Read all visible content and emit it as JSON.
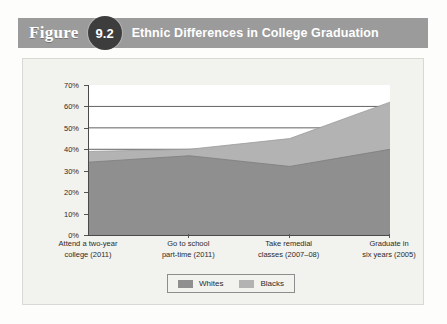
{
  "figure": {
    "word": "Figure",
    "number": "9.2",
    "title": "Ethnic Differences in College Graduation"
  },
  "colors": {
    "banner": "#9b9b9b",
    "badge": "#3d3d3d",
    "card": "#f2f2ef",
    "whites_area": "#b3b3b3",
    "blacks_area": "#8f8f8f",
    "axis": "#4a4a4a",
    "gridline": "#3a3a3a"
  },
  "chart_data": {
    "type": "area",
    "title": "Ethnic Differences in College Graduation",
    "xlabel": "",
    "ylabel": "",
    "ylim": [
      0,
      70
    ],
    "yticks": [
      0,
      10,
      20,
      30,
      40,
      50,
      60,
      70
    ],
    "ytick_labels": [
      "0%",
      "10%",
      "20%",
      "30%",
      "40%",
      "50%",
      "60%",
      "70%"
    ],
    "grid": true,
    "gridlines_at": [
      40,
      50,
      60
    ],
    "legend_position": "bottom",
    "categories": [
      "Attend a two-year college (2011)",
      "Go to school part-time (2011)",
      "Take remedial classes (2007–08)",
      "Graduate in six years (2005)"
    ],
    "category_lines": [
      [
        "Attend a two-year",
        "college (2011)"
      ],
      [
        "Go to school",
        "part-time (2011)"
      ],
      [
        "Take remedial",
        "classes (2007–08)"
      ],
      [
        "Graduate in",
        "six years (2005)"
      ]
    ],
    "series": [
      {
        "name": "Whites",
        "values": [
          39,
          40,
          45,
          62
        ],
        "color": "#b3b3b3"
      },
      {
        "name": "Blacks",
        "values": [
          34,
          37,
          32,
          40
        ],
        "color": "#8f8f8f"
      }
    ]
  },
  "legend": {
    "items": [
      {
        "label": "Whites",
        "color": "#8f8f8f"
      },
      {
        "label": "Blacks",
        "color": "#b3b3b3"
      }
    ]
  }
}
